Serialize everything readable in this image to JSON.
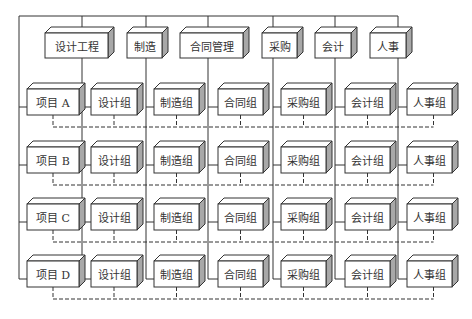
{
  "diagram": {
    "type": "matrix-organization",
    "colors": {
      "line": "#333333",
      "box_front": "#ffffff",
      "box_side": "#a8a8a8",
      "text": "#333333"
    },
    "departments": [
      {
        "label": "设计工程",
        "x": 45,
        "w": 63,
        "line_x": 82
      },
      {
        "label": "制造",
        "x": 127,
        "w": 35,
        "line_x": 146
      },
      {
        "label": "合同管理",
        "x": 180,
        "w": 63,
        "line_x": 208
      },
      {
        "label": "采购",
        "x": 262,
        "w": 35,
        "line_x": 273
      },
      {
        "label": "会计",
        "x": 315,
        "w": 36,
        "line_x": 335
      },
      {
        "label": "人事",
        "x": 370,
        "w": 36,
        "line_x": 398
      }
    ],
    "projects": [
      {
        "label": "项目 A",
        "y": 89
      },
      {
        "label": "项目 B",
        "y": 147
      },
      {
        "label": "项目 C",
        "y": 204
      },
      {
        "label": "项目 D",
        "y": 261
      }
    ],
    "project_column": {
      "x": 27,
      "w": 52,
      "line_x": 19
    },
    "groups": [
      {
        "label": "设计组",
        "x": 91,
        "w": 46
      },
      {
        "label": "制造组",
        "x": 154,
        "w": 45
      },
      {
        "label": "合同组",
        "x": 218,
        "w": 45
      },
      {
        "label": "采购组",
        "x": 281,
        "w": 45
      },
      {
        "label": "会计组",
        "x": 345,
        "w": 45
      },
      {
        "label": "人事组",
        "x": 407,
        "w": 45
      }
    ],
    "rows": [
      {
        "project": "项目 A",
        "members": [
          "设计组",
          "制造组",
          "合同组",
          "采购组",
          "会计组",
          "人事组"
        ]
      },
      {
        "project": "项目 B",
        "members": [
          "设计组",
          "制造组",
          "合同组",
          "采购组",
          "会计组",
          "人事组"
        ]
      },
      {
        "project": "项目 C",
        "members": [
          "设计组",
          "制造组",
          "合同组",
          "采购组",
          "会计组",
          "人事组"
        ]
      },
      {
        "project": "项目 D",
        "members": [
          "设计组",
          "制造组",
          "合同组",
          "采购组",
          "会计组",
          "人事组"
        ]
      }
    ],
    "geometry": {
      "top_line_y": 16,
      "dept_box_y": 33,
      "dept_box_h": 25,
      "row_box_h": 26,
      "depth": 6
    }
  }
}
